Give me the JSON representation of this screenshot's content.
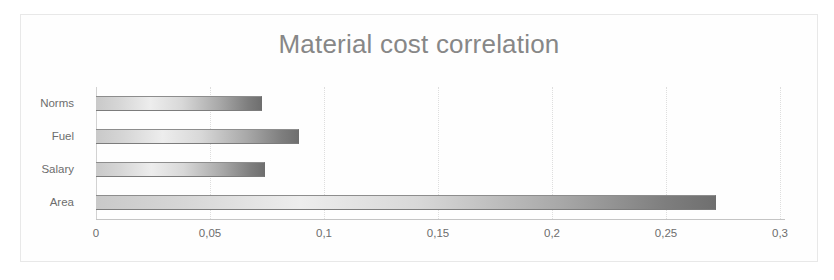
{
  "chart_data": {
    "type": "bar",
    "orientation": "horizontal",
    "title": "Material cost correlation",
    "xlabel": "",
    "ylabel": "",
    "categories": [
      "Norms",
      "Fuel",
      "Salary",
      "Area"
    ],
    "values": [
      0.073,
      0.089,
      0.074,
      0.272
    ],
    "value_labels": [
      "0,073",
      "0,089",
      "0,074",
      "0,272"
    ],
    "xlim": [
      0,
      0.3
    ],
    "xticks": [
      0,
      0.05,
      0.1,
      0.15,
      0.2,
      0.25,
      0.3
    ],
    "xtick_labels": [
      "0",
      "0,05",
      "0,1",
      "0,15",
      "0,2",
      "0,25",
      "0,3"
    ],
    "grid": true,
    "grid_axis": "x",
    "legend": false,
    "decimal_separator": ",",
    "series": [
      {
        "name": "Correlation",
        "values": [
          0.073,
          0.089,
          0.074,
          0.272
        ]
      }
    ],
    "colors": {
      "bar_gradient_start": "#c9c9c9",
      "bar_gradient_mid": "#ededed",
      "bar_gradient_end": "#6f6f6f",
      "bar_outline": "#7c7c7c",
      "title": "#878787",
      "tick_text": "#6d6d6d",
      "gridline": "#dedede",
      "axis_line": "#c4c4c4",
      "frame_border": "#e8e8e8",
      "background": "#fefefe"
    }
  }
}
